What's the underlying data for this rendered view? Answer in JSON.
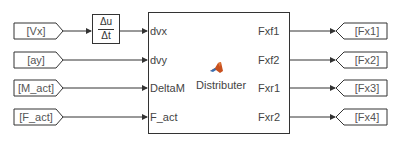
{
  "from_tags": [
    {
      "label": "[Vx]"
    },
    {
      "label": "[ay]"
    },
    {
      "label": "[M_act]"
    },
    {
      "label": "[F_act]"
    }
  ],
  "derivative_block": {
    "numerator": "Δu",
    "denominator": "Δt"
  },
  "main_block": {
    "name": "Distributer",
    "icon": "matlab-logo-icon",
    "inputs": [
      "dvx",
      "dvy",
      "DeltaM",
      "F_act"
    ],
    "outputs": [
      "Fxf1",
      "Fxf2",
      "Fxr1",
      "Fxr2"
    ]
  },
  "goto_tags": [
    {
      "label": "[Fx1]"
    },
    {
      "label": "[Fx2]"
    },
    {
      "label": "[Fx3]"
    },
    {
      "label": "[Fx4]"
    }
  ],
  "colors": {
    "line": "#333333",
    "text": "#444444",
    "matlab_icon_primary": "#c8501e",
    "matlab_icon_secondary": "#3a6fb0"
  }
}
